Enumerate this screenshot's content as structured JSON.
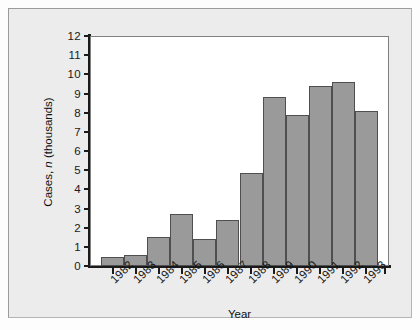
{
  "chart_data": {
    "type": "bar",
    "title": "",
    "xlabel": "Year",
    "ylabel": "Cases, n (thousands)",
    "ylabel_parts": {
      "pre": "Cases, ",
      "italic": "n",
      "post": " (thousands)"
    },
    "categories": [
      "1982",
      "1983",
      "1984",
      "1985",
      "1986",
      "1987",
      "1988",
      "1989",
      "1990",
      "1991",
      "1992",
      "1993"
    ],
    "values": [
      0.45,
      0.55,
      1.5,
      2.7,
      1.4,
      2.4,
      4.85,
      8.8,
      7.9,
      9.4,
      9.6,
      8.1
    ],
    "ylim": [
      0,
      12
    ],
    "yticks": [
      0,
      1,
      2,
      3,
      4,
      5,
      6,
      7,
      8,
      9,
      10,
      11,
      12
    ],
    "ytick_labels": [
      "0",
      "1",
      "2",
      "3",
      "4",
      "5",
      "6",
      "7",
      "8",
      "9",
      "10",
      "11",
      "12"
    ],
    "grid": false,
    "legend": null,
    "bar_color": "#9a9a9a",
    "bar_edge_color": "#4f4f4f",
    "axis_color": "#1b1b1b",
    "plot_background": "#ffffff",
    "figure_background": "#ececec"
  }
}
